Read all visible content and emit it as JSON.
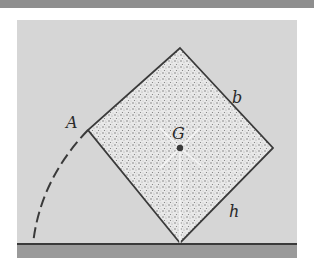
{
  "figure": {
    "labels": {
      "A": "A",
      "G": "G",
      "b": "b",
      "h": "h"
    },
    "colors": {
      "background_panel": "#d6d6d6",
      "top_bar": "#8e8e8e",
      "ground_band": "#9a9a9a",
      "outline": "#3a3a3a",
      "fill_speckle_light": "#f2f2f2",
      "fill_speckle_dark": "#6a6a6a"
    }
  }
}
